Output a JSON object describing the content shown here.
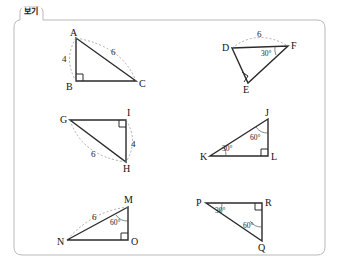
{
  "legend": {
    "label": "보기"
  },
  "frame": {
    "stroke_color": "#b9b9b9",
    "corner_radius": 8
  },
  "figures": [
    {
      "id": "triangle-abc",
      "vertices": [
        {
          "name": "A",
          "x": 76,
          "y": 38,
          "label_x": 70,
          "label_y": 28
        },
        {
          "name": "B",
          "x": 76,
          "y": 81,
          "label_x": 66,
          "label_y": 82
        },
        {
          "name": "C",
          "x": 136,
          "y": 81,
          "label_x": 139,
          "label_y": 79
        }
      ],
      "right_angle_at": "B",
      "measures": [
        {
          "text": "4",
          "x": 62,
          "y": 55
        },
        {
          "text": "6",
          "x": 111,
          "y": 48
        }
      ],
      "angles": []
    },
    {
      "id": "triangle-def",
      "vertices": [
        {
          "name": "D",
          "x": 232,
          "y": 48,
          "label_x": 222,
          "label_y": 43
        },
        {
          "name": "E",
          "x": 248,
          "y": 83,
          "label_x": 243,
          "label_y": 85
        },
        {
          "name": "F",
          "x": 288,
          "y": 46,
          "label_x": 291,
          "label_y": 41
        }
      ],
      "right_angle_at": "E",
      "measures": [
        {
          "text": "6",
          "x": 257,
          "y": 30
        }
      ],
      "angles": [
        {
          "text": "30°",
          "x": 261,
          "y": 50
        }
      ]
    },
    {
      "id": "triangle-gih",
      "vertices": [
        {
          "name": "G",
          "x": 70,
          "y": 120,
          "label_x": 60,
          "label_y": 115
        },
        {
          "name": "I",
          "x": 126,
          "y": 120,
          "label_x": 127,
          "label_y": 108
        },
        {
          "name": "H",
          "x": 126,
          "y": 162,
          "label_x": 123,
          "label_y": 164
        }
      ],
      "right_angle_at": "I",
      "measures": [
        {
          "text": "4",
          "x": 131,
          "y": 140
        },
        {
          "text": "6",
          "x": 91,
          "y": 150
        }
      ],
      "angles": []
    },
    {
      "id": "triangle-jkl",
      "vertices": [
        {
          "name": "J",
          "x": 268,
          "y": 119,
          "label_x": 265,
          "label_y": 108
        },
        {
          "name": "K",
          "x": 210,
          "y": 156,
          "label_x": 200,
          "label_y": 152
        },
        {
          "name": "L",
          "x": 268,
          "y": 156,
          "label_x": 271,
          "label_y": 152
        }
      ],
      "right_angle_at": "L",
      "measures": [],
      "angles": [
        {
          "text": "60°",
          "x": 250,
          "y": 134
        },
        {
          "text": "30°",
          "x": 222,
          "y": 145
        }
      ]
    },
    {
      "id": "triangle-mno",
      "vertices": [
        {
          "name": "M",
          "x": 128,
          "y": 207,
          "label_x": 124,
          "label_y": 195
        },
        {
          "name": "N",
          "x": 67,
          "y": 240,
          "label_x": 57,
          "label_y": 237
        },
        {
          "name": "O",
          "x": 128,
          "y": 240,
          "label_x": 131,
          "label_y": 237
        }
      ],
      "right_angle_at": "O",
      "measures": [
        {
          "text": "6",
          "x": 92,
          "y": 213
        }
      ],
      "angles": [
        {
          "text": "60°",
          "x": 110,
          "y": 219
        }
      ]
    },
    {
      "id": "triangle-pqr",
      "vertices": [
        {
          "name": "P",
          "x": 206,
          "y": 203,
          "label_x": 196,
          "label_y": 198
        },
        {
          "name": "R",
          "x": 262,
          "y": 203,
          "label_x": 265,
          "label_y": 198
        },
        {
          "name": "Q",
          "x": 262,
          "y": 241,
          "label_x": 258,
          "label_y": 243
        }
      ],
      "right_angle_at": "R",
      "measures": [],
      "angles": [
        {
          "text": "30°",
          "x": 215,
          "y": 207
        },
        {
          "text": "60°",
          "x": 243,
          "y": 222
        }
      ]
    }
  ]
}
